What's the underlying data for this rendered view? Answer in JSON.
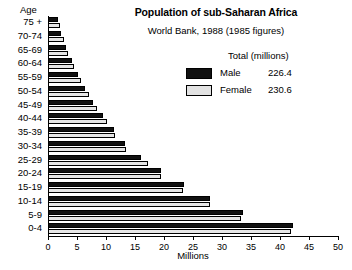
{
  "chart_data": {
    "type": "bar",
    "title": "Population of sub-Saharan Africa",
    "subtitle": "World Bank, 1988 (1985 figures)",
    "xlabel": "Millions",
    "ylabel": "Age",
    "xlim": [
      0,
      50
    ],
    "xticks": [
      0,
      5,
      10,
      15,
      20,
      25,
      30,
      35,
      40,
      45,
      50
    ],
    "xtick_labels": [
      "0",
      "5",
      "10",
      "15",
      "20",
      "25",
      "30",
      "35",
      "40",
      "45",
      "50"
    ],
    "grid": false,
    "orientation": "horizontal",
    "legend_position": "upper-right-inside",
    "categories": [
      "75 +",
      "70-74",
      "65-69",
      "60-64",
      "55-59",
      "50-54",
      "45-49",
      "40-44",
      "35-39",
      "30-34",
      "25-29",
      "20-24",
      "15-19",
      "10-14",
      "5-9",
      "0-4"
    ],
    "series": [
      {
        "name": "Male",
        "color": "#111111",
        "total": "226.4",
        "values": [
          1.8,
          2.3,
          3.1,
          4.1,
          5.2,
          6.4,
          7.8,
          9.4,
          11.4,
          13.2,
          16.1,
          19.5,
          23.4,
          28.0,
          33.6,
          42.2
        ]
      },
      {
        "name": "Female",
        "color": "#e6e6e6",
        "total": "230.6",
        "values": [
          2.1,
          2.7,
          3.5,
          4.5,
          5.7,
          7.0,
          8.4,
          10.2,
          11.6,
          13.5,
          17.3,
          19.4,
          23.2,
          27.9,
          33.3,
          41.9
        ]
      }
    ]
  },
  "legend": {
    "header": "Total (millions)",
    "male_label": "Male",
    "male_total": "226.4",
    "female_label": "Female",
    "female_total": "230.6"
  }
}
